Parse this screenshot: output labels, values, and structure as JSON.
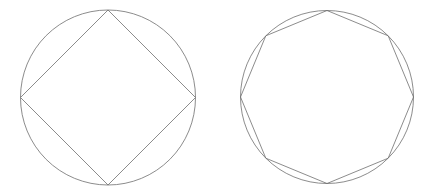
{
  "figure": {
    "background_color": "#ffffff",
    "stroke_color": "#6f6f6f",
    "stroke_width": 0.8,
    "width": 438,
    "height": 192,
    "panels": [
      {
        "name": "inscribed-square-panel",
        "label": "Circle with inscribed square",
        "circle": {
          "name": "circumscribed-circle",
          "cx": 108,
          "cy": 97.5,
          "r": 87.5
        },
        "polygon": {
          "name": "inscribed-square",
          "sides": 4,
          "rotation_deg": -90,
          "cx": 108,
          "cy": 97.5,
          "r": 87.5,
          "vertices": [
            [
              108,
              10
            ],
            [
              195.5,
              97.5
            ],
            [
              108,
              185
            ],
            [
              20.5,
              97.5
            ]
          ]
        }
      },
      {
        "name": "inscribed-octagon-panel",
        "label": "Circle with inscribed octagon",
        "circle": {
          "name": "circumscribed-circle",
          "cx": 327,
          "cy": 97,
          "r": 86.5
        },
        "polygon": {
          "name": "inscribed-octagon",
          "sides": 8,
          "rotation_deg": -90,
          "cx": 327,
          "cy": 97,
          "r": 86.5,
          "vertices": [
            [
              327,
              10.5
            ],
            [
              388.2,
              35.8
            ],
            [
              413.5,
              97
            ],
            [
              388.2,
              158.2
            ],
            [
              327,
              183.5
            ],
            [
              265.8,
              158.2
            ],
            [
              240.5,
              97
            ],
            [
              265.8,
              35.8
            ]
          ]
        }
      }
    ]
  }
}
